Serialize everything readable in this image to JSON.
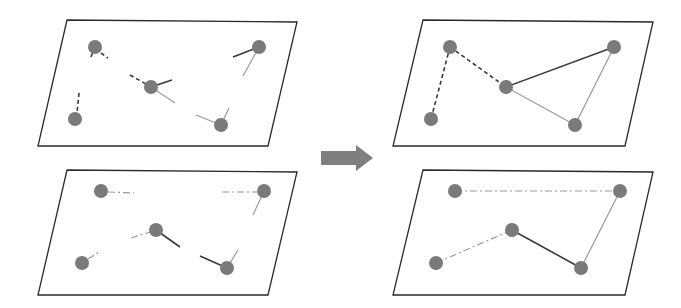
{
  "colors": {
    "background": "#ffffff",
    "plane_stroke": "#2a2a2a",
    "node_fill": "#7a7a7a",
    "dark_edge": "#3a3a3a",
    "light_edge": "#9a9a9a",
    "arrow_fill": "#7f7f7f"
  },
  "panels": [
    {
      "id": "top-left",
      "label": "input-layer-1-fragments",
      "plane": [
        [
          67,
          20
        ],
        [
          297,
          22
        ],
        [
          268,
          146
        ],
        [
          38,
          146
        ]
      ],
      "nodes": [
        [
          95,
          47
        ],
        [
          259,
          47
        ],
        [
          151,
          87
        ],
        [
          75,
          119
        ],
        [
          221,
          125
        ]
      ],
      "edges": [
        {
          "from": [
            95,
            47
          ],
          "to": [
            91,
            57
          ],
          "style": "solid",
          "tone": "dark"
        },
        {
          "from": [
            101,
            53
          ],
          "to": [
            108,
            58
          ],
          "style": "dashed",
          "tone": "dark"
        },
        {
          "from": [
            130,
            75
          ],
          "to": [
            146,
            84
          ],
          "style": "dashed",
          "tone": "dark"
        },
        {
          "from": [
            151,
            87
          ],
          "to": [
            172,
            80
          ],
          "style": "solid",
          "tone": "dark"
        },
        {
          "from": [
            151,
            87
          ],
          "to": [
            175,
            103
          ],
          "style": "solid",
          "tone": "light"
        },
        {
          "from": [
            79,
            93
          ],
          "to": [
            77,
            113
          ],
          "style": "dashed",
          "tone": "dark"
        },
        {
          "from": [
            259,
            47
          ],
          "to": [
            233,
            57
          ],
          "style": "solid",
          "tone": "dark"
        },
        {
          "from": [
            259,
            47
          ],
          "to": [
            243,
            76
          ],
          "style": "solid",
          "tone": "light"
        },
        {
          "from": [
            221,
            125
          ],
          "to": [
            196,
            115
          ],
          "style": "solid",
          "tone": "light"
        },
        {
          "from": [
            221,
            125
          ],
          "to": [
            229,
            108
          ],
          "style": "solid",
          "tone": "light"
        }
      ]
    },
    {
      "id": "top-right",
      "label": "output-layer-1-connected",
      "plane": [
        [
          423,
          20
        ],
        [
          653,
          22
        ],
        [
          625,
          146
        ],
        [
          393,
          146
        ]
      ],
      "nodes": [
        [
          450,
          47
        ],
        [
          614,
          47
        ],
        [
          506,
          87
        ],
        [
          431,
          119
        ],
        [
          575,
          125
        ]
      ],
      "edges": [
        {
          "from": [
            450,
            47
          ],
          "to": [
            431,
            119
          ],
          "style": "dashed",
          "tone": "dark"
        },
        {
          "from": [
            450,
            47
          ],
          "to": [
            506,
            87
          ],
          "style": "dashed",
          "tone": "dark"
        },
        {
          "from": [
            506,
            87
          ],
          "to": [
            614,
            47
          ],
          "style": "solid",
          "tone": "dark"
        },
        {
          "from": [
            506,
            87
          ],
          "to": [
            575,
            125
          ],
          "style": "solid",
          "tone": "light"
        },
        {
          "from": [
            614,
            47
          ],
          "to": [
            575,
            125
          ],
          "style": "solid",
          "tone": "light"
        }
      ]
    },
    {
      "id": "bottom-left",
      "label": "input-layer-2-fragments",
      "plane": [
        [
          67,
          170
        ],
        [
          297,
          172
        ],
        [
          268,
          295
        ],
        [
          38,
          295
        ]
      ],
      "nodes": [
        [
          101,
          191
        ],
        [
          264,
          191
        ],
        [
          156,
          230
        ],
        [
          82,
          263
        ],
        [
          227,
          268
        ]
      ],
      "edges": [
        {
          "from": [
            108,
            192
          ],
          "to": [
            134,
            193
          ],
          "style": "dashdot",
          "tone": "light"
        },
        {
          "from": [
            222,
            192
          ],
          "to": [
            257,
            192
          ],
          "style": "dashdot",
          "tone": "light"
        },
        {
          "from": [
            264,
            191
          ],
          "to": [
            253,
            215
          ],
          "style": "solid",
          "tone": "light"
        },
        {
          "from": [
            131,
            238
          ],
          "to": [
            150,
            232
          ],
          "style": "dashdot",
          "tone": "light"
        },
        {
          "from": [
            156,
            230
          ],
          "to": [
            180,
            247
          ],
          "style": "solid",
          "tone": "dark"
        },
        {
          "from": [
            88,
            259
          ],
          "to": [
            99,
            252
          ],
          "style": "dashdot",
          "tone": "light"
        },
        {
          "from": [
            227,
            268
          ],
          "to": [
            200,
            256
          ],
          "style": "solid",
          "tone": "dark"
        },
        {
          "from": [
            227,
            268
          ],
          "to": [
            238,
            250
          ],
          "style": "solid",
          "tone": "light"
        }
      ]
    },
    {
      "id": "bottom-right",
      "label": "output-layer-2-connected",
      "plane": [
        [
          423,
          170
        ],
        [
          653,
          172
        ],
        [
          625,
          295
        ],
        [
          393,
          295
        ]
      ],
      "nodes": [
        [
          455,
          191
        ],
        [
          620,
          191
        ],
        [
          512,
          230
        ],
        [
          436,
          263
        ],
        [
          581,
          268
        ]
      ],
      "edges": [
        {
          "from": [
            455,
            191
          ],
          "to": [
            620,
            191
          ],
          "style": "dashdot",
          "tone": "light"
        },
        {
          "from": [
            436,
            263
          ],
          "to": [
            512,
            230
          ],
          "style": "dashdot",
          "tone": "light"
        },
        {
          "from": [
            512,
            230
          ],
          "to": [
            581,
            268
          ],
          "style": "solid",
          "tone": "dark"
        },
        {
          "from": [
            581,
            268
          ],
          "to": [
            620,
            191
          ],
          "style": "solid",
          "tone": "light"
        }
      ]
    }
  ],
  "arrow": {
    "label": "transform-arrow",
    "points": [
      [
        321,
        151
      ],
      [
        356,
        151
      ],
      [
        356,
        145
      ],
      [
        373,
        158
      ],
      [
        356,
        171
      ],
      [
        356,
        165
      ],
      [
        321,
        165
      ]
    ]
  },
  "node_radius": 7
}
